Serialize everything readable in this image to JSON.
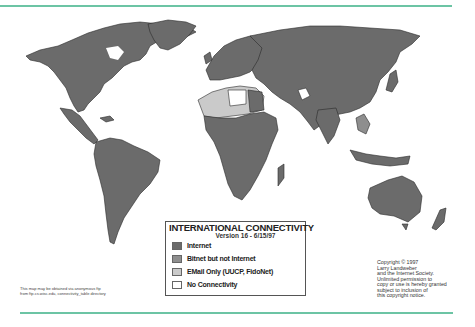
{
  "map": {
    "title": "INTERNATIONAL CONNECTIVITY",
    "version": "Version 16 - 6/15/97",
    "legend": [
      {
        "label": "Internet",
        "color": "#6b6b6b"
      },
      {
        "label": "Bitnet but not Internet",
        "color": "#8e8e8e"
      },
      {
        "label": "EMail Only (UUCP, FidoNet)",
        "color": "#cacaca"
      },
      {
        "label": "No Connectivity",
        "color": "#ffffff"
      }
    ],
    "copyright_lines": "Copyright © 1997\nLarry Landweber\nand the Internet Society.\nUnlimited permission to\ncopy or use is hereby granted\nsubject to inclusion of\nthis copyright notice.",
    "ftp_note": "This map may be obtained via anonymous ftp\nfrom ftp.cs.wisc.edu, connectivity_table directory",
    "rule_color": "#6cc4a4"
  }
}
